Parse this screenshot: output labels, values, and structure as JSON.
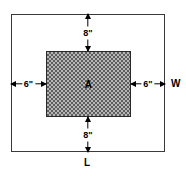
{
  "diagram": {
    "outer_region": {
      "name": "sheet",
      "width_label": "W",
      "length_label": "L",
      "fill": "#ffffff",
      "stroke": "#3a3a3a"
    },
    "inner_region": {
      "name": "hatched-area",
      "label": "A",
      "fill": "#b6b6b6",
      "hatch": "#5e5e5e",
      "stroke": "#2a2a2a"
    },
    "dimensions": [
      {
        "id": "top",
        "value": "8\"",
        "orientation": "vertical",
        "arrows": "double"
      },
      {
        "id": "bottom",
        "value": "8\"",
        "orientation": "vertical",
        "arrows": "double"
      },
      {
        "id": "left",
        "value": "6\"",
        "orientation": "horizontal",
        "arrows": "double"
      },
      {
        "id": "right",
        "value": "6\"",
        "orientation": "horizontal",
        "arrows": "double"
      }
    ]
  },
  "chart_data": {
    "type": "diagram",
    "shapes": [
      {
        "name": "outer-rectangle",
        "role": "sheet",
        "x": 11,
        "y": 14,
        "width": 154,
        "height": 138,
        "fill": "#ffffff",
        "stroke": "#3a3a3a",
        "labels": [
          "W",
          "L"
        ]
      },
      {
        "name": "inner-rectangle",
        "role": "hatched-area",
        "x": 46,
        "y": 51,
        "width": 85,
        "height": 66,
        "fill": "#b6b6b6",
        "hatch_pattern": "checkerboard",
        "stroke": "#2a2a2a",
        "labels": [
          "A"
        ]
      }
    ],
    "annotations": [
      {
        "text": "8\"",
        "position": "top-margin",
        "x": 88,
        "y": 33
      },
      {
        "text": "8\"",
        "position": "bottom-margin",
        "x": 88,
        "y": 134
      },
      {
        "text": "6\"",
        "position": "left-margin",
        "x": 28,
        "y": 84
      },
      {
        "text": "6\"",
        "position": "right-margin",
        "x": 148,
        "y": 84
      },
      {
        "text": "A",
        "position": "inner-center",
        "x": 88,
        "y": 84
      },
      {
        "text": "W",
        "position": "right-edge",
        "x": 175,
        "y": 84
      },
      {
        "text": "L",
        "position": "bottom-edge",
        "x": 88,
        "y": 162
      }
    ]
  }
}
